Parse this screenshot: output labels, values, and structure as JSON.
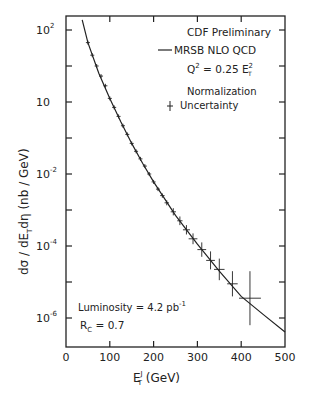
{
  "chart_data": {
    "type": "scatter",
    "title": "CDF Preliminary",
    "xlabel": "E_T^J (GeV)",
    "ylabel": "dσ / dE_T dη (nb / GeV)",
    "xlim": [
      0,
      500
    ],
    "ylim_log10": [
      -6.8,
      2.4
    ],
    "yscale": "log",
    "grid": false,
    "x_ticks": [
      0,
      100,
      200,
      300,
      400,
      500
    ],
    "x_tick_labels": [
      "0",
      "100",
      "200",
      "300",
      "400",
      "500"
    ],
    "y_tick_labels": [
      {
        "base": "10",
        "exp": "2",
        "log": 2
      },
      {
        "base": "10",
        "exp": "",
        "log": 0
      },
      {
        "base": "10",
        "exp": "-2",
        "log": -2
      },
      {
        "base": "10",
        "exp": "-4",
        "log": -4
      },
      {
        "base": "10",
        "exp": "-6",
        "log": -6
      }
    ],
    "legend": {
      "title": "CDF Preliminary",
      "line_label": "MRSB NLO  QCD",
      "scale_label": "Q",
      "scale_sup": "2",
      "scale_eq": " = 0.25 E",
      "scale_sup2": "2",
      "scale_sub": "T",
      "norm_label_1": "Normalization",
      "norm_label_2": "Uncertainty"
    },
    "annotations": {
      "luminosity": "Luminosity = 4.2 pb",
      "luminosity_sup": "-1",
      "rc_label": "R",
      "rc_sub": "C",
      "rc_value": " = 0.7"
    },
    "series": [
      {
        "name": "MRSB NLO QCD",
        "kind": "line",
        "x": [
          37,
          50,
          75,
          100,
          125,
          150,
          175,
          200,
          250,
          300,
          350,
          400,
          450,
          500
        ],
        "log10_y": [
          2.28,
          1.65,
          0.8,
          0.1,
          -0.55,
          -1.15,
          -1.7,
          -2.22,
          -3.15,
          -3.95,
          -4.7,
          -5.4,
          -5.9,
          -6.39
        ]
      },
      {
        "name": "CDF data",
        "kind": "points",
        "x": [
          50,
          60,
          70,
          80,
          90,
          100,
          110,
          120,
          130,
          140,
          150,
          160,
          170,
          180,
          190,
          200,
          210,
          220,
          230,
          245,
          260,
          275,
          290,
          310,
          330,
          350,
          380,
          420
        ],
        "log10_y": [
          1.65,
          1.3,
          1.0,
          0.72,
          0.45,
          0.1,
          -0.15,
          -0.4,
          -0.66,
          -0.9,
          -1.15,
          -1.37,
          -1.58,
          -1.78,
          -2.0,
          -2.22,
          -2.42,
          -2.6,
          -2.8,
          -3.05,
          -3.3,
          -3.55,
          -3.8,
          -4.1,
          -4.4,
          -4.65,
          -5.05,
          -5.45
        ],
        "x_err": [
          0,
          0,
          0,
          0,
          0,
          0,
          0,
          0,
          0,
          0,
          0,
          0,
          0,
          0,
          0,
          0,
          0,
          5,
          5,
          6,
          6,
          8,
          10,
          10,
          10,
          12,
          12,
          25
        ],
        "log10_y_err": [
          0.03,
          0.03,
          0.03,
          0.03,
          0.03,
          0.03,
          0.03,
          0.03,
          0.03,
          0.03,
          0.03,
          0.03,
          0.03,
          0.03,
          0.03,
          0.04,
          0.05,
          0.06,
          0.07,
          0.1,
          0.12,
          0.13,
          0.15,
          0.2,
          0.25,
          0.3,
          0.35,
          0.75
        ]
      }
    ]
  }
}
